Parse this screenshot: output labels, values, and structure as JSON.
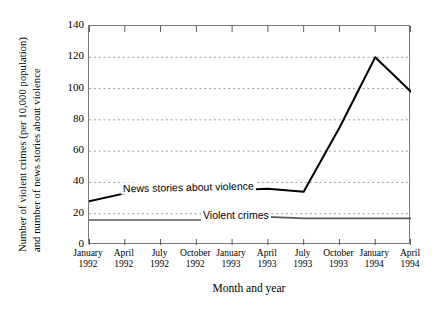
{
  "chart_data": {
    "type": "line",
    "title": "",
    "xlabel": "Month and year",
    "ylabel": "Number of violent crimes (per 10,000 population) and number of news stories about violence",
    "ylabel_lines": [
      "Number of violent crimes (per 10,000 population)",
      "and number of news stories about violence"
    ],
    "categories": [
      "January 1992",
      "April 1992",
      "July 1992",
      "October 1992",
      "January 1993",
      "April 1993",
      "July 1993",
      "October 1993",
      "January 1994",
      "April 1994"
    ],
    "category_lines": [
      [
        "January",
        "1992"
      ],
      [
        "April",
        "1992"
      ],
      [
        "July",
        "1992"
      ],
      [
        "October",
        "1992"
      ],
      [
        "January",
        "1993"
      ],
      [
        "April",
        "1993"
      ],
      [
        "July",
        "1993"
      ],
      [
        "October",
        "1993"
      ],
      [
        "January",
        "1994"
      ],
      [
        "April",
        "1994"
      ]
    ],
    "ylim": [
      0,
      140
    ],
    "yticks": [
      0,
      20,
      40,
      60,
      80,
      100,
      120,
      140
    ],
    "grid": true,
    "grid_style": "dotted-horizontal",
    "legend": "inline-annotations",
    "series": [
      {
        "name": "News stories about violence",
        "values": [
          28,
          33,
          36,
          36,
          35,
          36,
          34,
          75,
          120,
          98
        ],
        "color": "#000000",
        "line_width": 2.0
      },
      {
        "name": "Violent crimes",
        "values": [
          16,
          16,
          16,
          16,
          16,
          18,
          17,
          17,
          17,
          17
        ],
        "color": "#595959",
        "line_width": 1.6
      }
    ],
    "annotations": [
      {
        "text": "News stories about violence",
        "series": "News stories about violence"
      },
      {
        "text": "Violent crimes",
        "series": "Violent crimes"
      }
    ]
  },
  "axes": {
    "y_tick_labels": [
      "140",
      "120",
      "100",
      "80",
      "60",
      "40",
      "20",
      "0"
    ]
  }
}
